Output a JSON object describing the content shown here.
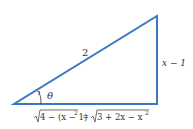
{
  "diagram": {
    "type": "right-triangle",
    "stroke_color": "#3a78c4",
    "hypotenuse_label": "2",
    "opposite_label": "x − 1",
    "angle_label": "θ",
    "adjacent_label_lhs_radicand": "4 − (x − 1)",
    "adjacent_label_lhs_exp": "2",
    "adjacent_label_eq": "=",
    "adjacent_label_rhs_radicand": "3 + 2x − x",
    "adjacent_label_rhs_exp": "2"
  }
}
